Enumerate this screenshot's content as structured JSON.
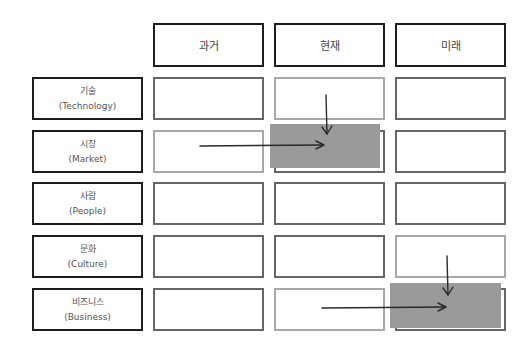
{
  "columns": [
    {
      "key": "past",
      "label": "과거"
    },
    {
      "key": "present",
      "label": "현재"
    },
    {
      "key": "future",
      "label": "미래"
    }
  ],
  "rows": [
    {
      "key": "technology",
      "label_ko": "기술",
      "label_en": "(Technology)"
    },
    {
      "key": "market",
      "label_ko": "시장",
      "label_en": "(Market)"
    },
    {
      "key": "people",
      "label_ko": "사람",
      "label_en": "(People)"
    },
    {
      "key": "culture",
      "label_ko": "문화",
      "label_en": "(Culture)"
    },
    {
      "key": "business",
      "label_ko": "비즈니스",
      "label_en": "(Business)"
    }
  ],
  "highlights": [
    {
      "row": "market",
      "column": "present",
      "color": "#9a9a9a"
    },
    {
      "row": "business",
      "column": "future",
      "color": "#9a9a9a"
    }
  ],
  "arrows": [
    {
      "from": "technology/present",
      "to": "market/present",
      "direction": "down"
    },
    {
      "from": "market/past",
      "to": "market/present",
      "direction": "right"
    },
    {
      "from": "culture/future",
      "to": "business/future",
      "direction": "down"
    },
    {
      "from": "business/present",
      "to": "business/future",
      "direction": "right"
    }
  ],
  "colors": {
    "frame": "#1e1e1e",
    "cell_border": "#666666",
    "cell_border_light": "#a8a8a8",
    "highlight": "#9a9a9a",
    "arrow": "#2a2a2a"
  }
}
